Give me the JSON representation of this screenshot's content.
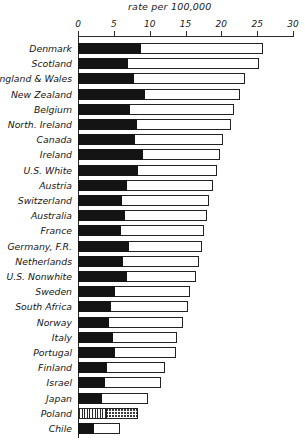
{
  "chart_data": {
    "type": "bar",
    "title": "rate per 100,000",
    "xlabel": "rate per 100,000",
    "ylabel": "",
    "orientation": "horizontal",
    "xlim": [
      0,
      30
    ],
    "xticks": [
      0,
      5,
      10,
      15,
      20,
      25,
      30
    ],
    "xtick_labels": [
      "0",
      "5",
      "10",
      "15",
      "20",
      "25",
      "30"
    ],
    "grid": false,
    "legend": "none",
    "stacked": true,
    "series": [
      {
        "name": "dark-segment",
        "values": [
          8.8,
          7.0,
          7.8,
          9.4,
          7.3,
          8.3,
          7.9,
          9.0,
          8.4,
          6.9,
          6.2,
          6.6,
          6.0,
          7.1,
          6.3,
          6.9,
          5.1,
          4.6,
          4.3,
          4.9,
          5.1,
          4.0,
          3.7,
          3.4,
          4.1,
          2.3
        ]
      },
      {
        "name": "light-segment",
        "values": [
          17.0,
          18.3,
          15.5,
          13.2,
          14.5,
          13.0,
          12.4,
          10.8,
          11.0,
          12.0,
          12.1,
          11.4,
          11.6,
          10.2,
          10.6,
          9.5,
          10.5,
          10.7,
          10.3,
          8.9,
          8.6,
          8.2,
          7.9,
          6.4,
          4.3,
          3.6
        ]
      }
    ],
    "categories": [
      "Denmark",
      "Scotland",
      "England & Wales",
      "New Zealand",
      "Belgium",
      "North. Ireland",
      "Canada",
      "Ireland",
      "U.S. White",
      "Austria",
      "Switzerland",
      "Australia",
      "France",
      "Germany, F.R.",
      "Netherlands",
      "U.S. Nonwhite",
      "Sweden",
      "South Africa",
      "Norway",
      "Italy",
      "Portugal",
      "Finland",
      "Israel",
      "Japan",
      "Poland",
      "Chile"
    ],
    "totals": [
      25.8,
      25.3,
      23.3,
      22.6,
      21.8,
      21.3,
      20.3,
      19.8,
      19.4,
      18.9,
      18.3,
      18.0,
      17.6,
      17.3,
      16.9,
      16.4,
      15.6,
      15.3,
      14.6,
      13.8,
      13.7,
      12.2,
      11.6,
      9.8,
      8.4,
      5.9
    ]
  },
  "rows": [
    {
      "label": "Denmark",
      "dark": 8.8,
      "total": 25.8,
      "pattern": "solid"
    },
    {
      "label": "Scotland",
      "dark": 7.0,
      "total": 25.3,
      "pattern": "solid"
    },
    {
      "label": "England & Wales",
      "dark": 7.8,
      "total": 23.3,
      "pattern": "solid"
    },
    {
      "label": "New Zealand",
      "dark": 9.4,
      "total": 22.6,
      "pattern": "solid"
    },
    {
      "label": "Belgium",
      "dark": 7.3,
      "total": 21.8,
      "pattern": "solid"
    },
    {
      "label": "North. Ireland",
      "dark": 8.3,
      "total": 21.3,
      "pattern": "solid"
    },
    {
      "label": "Canada",
      "dark": 7.9,
      "total": 20.3,
      "pattern": "solid"
    },
    {
      "label": "Ireland",
      "dark": 9.0,
      "total": 19.8,
      "pattern": "solid"
    },
    {
      "label": "U.S. White",
      "dark": 8.4,
      "total": 19.4,
      "pattern": "solid"
    },
    {
      "label": "Austria",
      "dark": 6.9,
      "total": 18.9,
      "pattern": "solid"
    },
    {
      "label": "Switzerland",
      "dark": 6.2,
      "total": 18.3,
      "pattern": "solid"
    },
    {
      "label": "Australia",
      "dark": 6.6,
      "total": 18.0,
      "pattern": "solid"
    },
    {
      "label": "France",
      "dark": 6.0,
      "total": 17.6,
      "pattern": "solid"
    },
    {
      "label": "Germany, F.R.",
      "dark": 7.1,
      "total": 17.3,
      "pattern": "solid"
    },
    {
      "label": "Netherlands",
      "dark": 6.3,
      "total": 16.9,
      "pattern": "solid"
    },
    {
      "label": "U.S. Nonwhite",
      "dark": 6.9,
      "total": 16.4,
      "pattern": "solid"
    },
    {
      "label": "Sweden",
      "dark": 5.1,
      "total": 15.6,
      "pattern": "solid"
    },
    {
      "label": "South Africa",
      "dark": 4.6,
      "total": 15.3,
      "pattern": "solid"
    },
    {
      "label": "Norway",
      "dark": 4.3,
      "total": 14.6,
      "pattern": "solid"
    },
    {
      "label": "Italy",
      "dark": 4.9,
      "total": 13.8,
      "pattern": "solid"
    },
    {
      "label": "Portugal",
      "dark": 5.1,
      "total": 13.7,
      "pattern": "solid"
    },
    {
      "label": "Finland",
      "dark": 4.0,
      "total": 12.2,
      "pattern": "solid"
    },
    {
      "label": "Israel",
      "dark": 3.7,
      "total": 11.6,
      "pattern": "solid"
    },
    {
      "label": "Japan",
      "dark": 3.4,
      "total": 9.8,
      "pattern": "solid"
    },
    {
      "label": "Poland",
      "dark": 4.1,
      "total": 8.4,
      "pattern": "hatched"
    },
    {
      "label": "Chile",
      "dark": 2.3,
      "total": 5.9,
      "pattern": "solid"
    }
  ],
  "colors": {
    "dark_segment": "#141414",
    "light_segment": "#ffffff",
    "outline": "#222222",
    "axis": "#2b2b2b",
    "text": "#161616",
    "background": "#ffffff"
  }
}
